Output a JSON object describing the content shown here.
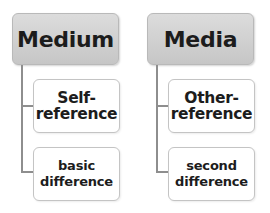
{
  "diagram": {
    "type": "hierarchy",
    "columns": [
      {
        "header": "Medium",
        "children": [
          {
            "label": "Self-reference",
            "line1": "Self-",
            "line2": "reference"
          },
          {
            "label": "basic difference",
            "line1": "basic",
            "line2": "difference"
          }
        ]
      },
      {
        "header": "Media",
        "children": [
          {
            "label": "Other-reference",
            "line1": "Other-",
            "line2": "reference"
          },
          {
            "label": "second difference",
            "line1": "second",
            "line2": "difference"
          }
        ]
      }
    ],
    "colors": {
      "header_fill": "#d0d0d0",
      "header_border": "#b9b9b9",
      "child_fill": "#ffffff",
      "child_border": "#c4c4c4",
      "connector": "#8e8e8e",
      "text": "#1c1c1c"
    }
  }
}
